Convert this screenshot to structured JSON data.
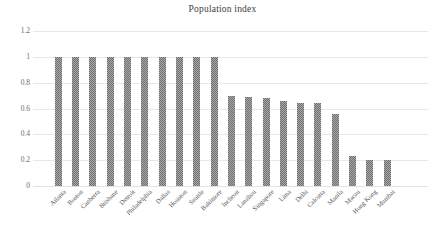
{
  "chart_data": {
    "type": "bar",
    "title": "Population index",
    "xlabel": "",
    "ylabel": "",
    "ylim": [
      0,
      1.2
    ],
    "yticks": [
      "0",
      "0.2",
      "0.4",
      "0.6",
      "0.8",
      "1",
      "1.2"
    ],
    "ytick_values": [
      0,
      0.2,
      0.4,
      0.6,
      0.8,
      1,
      1.2
    ],
    "grid": true,
    "legend": "none",
    "bar_color": "#6f6f6f",
    "categories": [
      "Atlanta",
      "Boston",
      "Canberra",
      "Brisbane",
      "Detroit",
      "Philadelphia",
      "Dallas",
      "Houston",
      "Seattle",
      "Baltimore",
      "Incheon",
      "Lanzhou",
      "Singapore",
      "Lima",
      "Delhi",
      "Calcutta",
      "Manila",
      "Macau",
      "Hong Kong",
      "Mumbai"
    ],
    "values": [
      1.0,
      1.0,
      1.0,
      1.0,
      1.0,
      1.0,
      1.0,
      1.0,
      1.0,
      1.0,
      0.7,
      0.69,
      0.68,
      0.66,
      0.64,
      0.64,
      0.56,
      0.23,
      0.2,
      0.2
    ]
  }
}
